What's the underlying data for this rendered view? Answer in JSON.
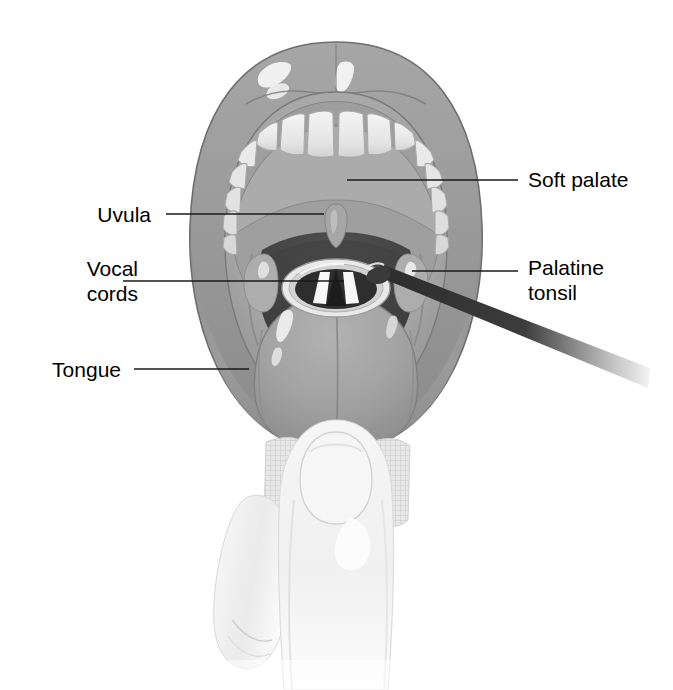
{
  "figure": {
    "background_color": "#ffffff"
  },
  "labels": [
    {
      "id": "soft-palate",
      "text": "Soft palate",
      "lines": [
        "Soft palate"
      ],
      "side": "right",
      "text_x": 528,
      "text_y": 167,
      "leader": {
        "x1": 347,
        "y1": 180,
        "x2": 518,
        "y2": 180
      }
    },
    {
      "id": "palatine-tonsil",
      "text": "Palatine tonsil",
      "lines": [
        "Palatine",
        "tonsil"
      ],
      "side": "right",
      "text_x": 528,
      "text_y": 255,
      "leader": {
        "x1": 412,
        "y1": 271,
        "x2": 518,
        "y2": 271
      }
    },
    {
      "id": "uvula",
      "text": "Uvula",
      "lines": [
        "Uvula"
      ],
      "side": "left",
      "text_x": 151,
      "text_y": 202,
      "leader": {
        "x1": 166,
        "y1": 214,
        "x2": 324,
        "y2": 214
      }
    },
    {
      "id": "vocal-cords",
      "text": "Vocal cords",
      "lines": [
        "Vocal",
        "cords"
      ],
      "side": "left",
      "text_x": 138,
      "text_y": 256,
      "leader": {
        "x1": 123,
        "y1": 281,
        "x2": 344,
        "y2": 281
      }
    },
    {
      "id": "tongue",
      "text": "Tongue",
      "lines": [
        "Tongue"
      ],
      "side": "left",
      "text_x": 121,
      "text_y": 357,
      "leader": {
        "x1": 134,
        "y1": 369,
        "x2": 249,
        "y2": 369
      }
    }
  ],
  "colors": {
    "line": "#1a1a1a",
    "text": "#000000",
    "lip_outer": "#9a9a9a",
    "lip_shadow": "#8b8b8b",
    "lip_highlight": "#f2f2f2",
    "palate": "#a8a8a8",
    "palate_deep": "#8e8e8e",
    "teeth": "#ececec",
    "teeth_shadow": "#cfcfcf",
    "pharynx_dark": "#4a4a4a",
    "pharynx_darker": "#3a3a3a",
    "tongue": "#a2a2a2",
    "tongue_shadow": "#8a8a8a",
    "larynx_ring": "#e6e6e6",
    "vocal_cord_white": "#f5f5f5",
    "instrument": "#2b2b2b",
    "skin": "#f4f4f4",
    "skin_shadow": "#dcdcdc",
    "gauze": "#e2e2e2"
  },
  "parts": [
    {
      "id": "upper-lip",
      "name": "upper lip"
    },
    {
      "id": "lower-lip",
      "name": "lower lip"
    },
    {
      "id": "upper-teeth",
      "name": "upper teeth arch"
    },
    {
      "id": "hard-palate",
      "name": "hard palate"
    },
    {
      "id": "soft-palate",
      "name": "soft palate"
    },
    {
      "id": "uvula",
      "name": "uvula"
    },
    {
      "id": "oropharynx",
      "name": "oropharynx"
    },
    {
      "id": "palatine-tonsil-left",
      "name": "palatine tonsil (patient left)"
    },
    {
      "id": "palatine-tonsil-right",
      "name": "palatine tonsil (patient right)"
    },
    {
      "id": "larynx-opening",
      "name": "laryngeal opening"
    },
    {
      "id": "vocal-cords",
      "name": "vocal cords"
    },
    {
      "id": "tongue",
      "name": "tongue"
    },
    {
      "id": "instrument",
      "name": "laryngeal instrument"
    },
    {
      "id": "thumb",
      "name": "examiner thumb"
    },
    {
      "id": "fingers",
      "name": "examiner fingers"
    },
    {
      "id": "gauze-left",
      "name": "gauze pad left"
    },
    {
      "id": "gauze-right",
      "name": "gauze pad right"
    }
  ]
}
